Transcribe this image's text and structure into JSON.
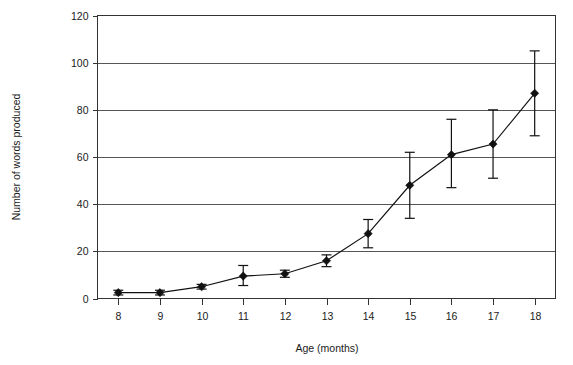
{
  "chart_data": {
    "type": "line",
    "title": "",
    "xlabel": "Age (months)",
    "ylabel": "Number of words produced",
    "x": [
      8,
      9,
      10,
      11,
      12,
      13,
      14,
      15,
      16,
      17,
      18
    ],
    "xtick_labels": [
      "8",
      "9",
      "10",
      "11",
      "12",
      "13",
      "14",
      "15",
      "16",
      "17",
      "18"
    ],
    "ytick_labels": [
      "0",
      "20",
      "40",
      "60",
      "80",
      "100",
      "120"
    ],
    "yticks": [
      0,
      20,
      40,
      60,
      80,
      100,
      120
    ],
    "ylim": [
      0,
      120
    ],
    "xlim": [
      7.5,
      18.5
    ],
    "grid": "horizontal",
    "legend": "none",
    "marker": "diamond",
    "series": [
      {
        "name": "Number of words produced",
        "values": [
          2.5,
          2.5,
          5,
          9.5,
          10.5,
          16,
          27.5,
          48,
          61,
          65.5,
          87
        ],
        "error_upper": [
          3.5,
          3.5,
          6,
          14,
          12,
          18.5,
          33.5,
          62,
          76,
          80,
          105
        ],
        "error_lower": [
          1.5,
          1.5,
          4,
          5.5,
          9,
          13.5,
          21.5,
          34,
          47,
          51,
          69
        ]
      }
    ]
  },
  "axis": {
    "x_title": "Age (months)",
    "y_title": "Number of words produced"
  }
}
